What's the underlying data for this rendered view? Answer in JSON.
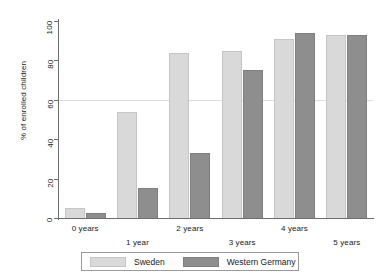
{
  "chart_data": {
    "type": "bar",
    "title": "",
    "subtitle": "",
    "xlabel": "",
    "ylabel": "% of enrolled children",
    "categories": [
      "0 years",
      "1 year",
      "2 years",
      "3 years",
      "4 years",
      "5 years"
    ],
    "series": [
      {
        "name": "Sweden",
        "color": "#d9d9d9",
        "values": [
          5,
          54,
          84,
          85,
          91,
          93
        ]
      },
      {
        "name": "Western Germany",
        "color": "#8e8e8e",
        "values": [
          2.5,
          15,
          33,
          75,
          94,
          93
        ]
      }
    ],
    "ylim": [
      0,
      100
    ],
    "yticks": [
      0,
      20,
      40,
      60,
      80,
      100
    ],
    "ytick_labels": [
      "0",
      "20",
      "40",
      "60",
      "80",
      "100"
    ],
    "grid": true,
    "gridlines_at": [
      60
    ],
    "legend_position": "bottom",
    "legend_entries": [
      "Sweden",
      "Western Germany"
    ],
    "xtick_stagger": true
  },
  "axis": {
    "y_title": "% of enrolled children",
    "ticks": [
      "0",
      "20",
      "40",
      "60",
      "80",
      "100"
    ]
  },
  "legend": {
    "sweden_label": "Sweden",
    "western_germany_label": "Western Germany"
  },
  "xaxis": {
    "labels": [
      "0 years",
      "1 year",
      "2 years",
      "3 years",
      "4 years",
      "5 years"
    ]
  }
}
